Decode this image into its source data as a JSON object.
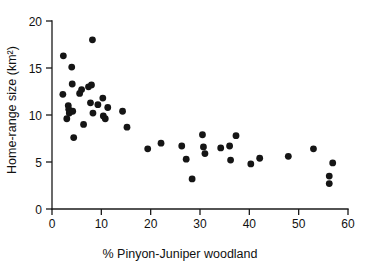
{
  "chart_data": {
    "type": "scatter",
    "title": "",
    "xlabel": "% Pinyon-Juniper woodland",
    "ylabel": "Home-range size (km²)",
    "xlim": [
      0,
      60
    ],
    "ylim": [
      0,
      20
    ],
    "xticks": [
      0,
      10,
      20,
      30,
      40,
      50,
      60
    ],
    "yticks": [
      0,
      5,
      10,
      15,
      20
    ],
    "xticklabels": [
      "0",
      "10",
      "20",
      "30",
      "40",
      "50",
      "60"
    ],
    "yticklabels": [
      "0",
      "5",
      "10",
      "15",
      "20"
    ],
    "grid": false,
    "legend": null,
    "marker": "filled-circle",
    "marker_color": "#151515",
    "points": [
      {
        "x": 2.3,
        "y": 16.3
      },
      {
        "x": 2.2,
        "y": 12.2
      },
      {
        "x": 3.0,
        "y": 9.6
      },
      {
        "x": 3.3,
        "y": 11.0
      },
      {
        "x": 3.4,
        "y": 10.6
      },
      {
        "x": 3.5,
        "y": 10.2
      },
      {
        "x": 4.0,
        "y": 15.1
      },
      {
        "x": 4.1,
        "y": 13.3
      },
      {
        "x": 4.2,
        "y": 10.4
      },
      {
        "x": 4.4,
        "y": 7.6
      },
      {
        "x": 5.6,
        "y": 12.3
      },
      {
        "x": 6.0,
        "y": 12.7
      },
      {
        "x": 6.4,
        "y": 9.0
      },
      {
        "x": 7.4,
        "y": 13.0
      },
      {
        "x": 7.8,
        "y": 11.3
      },
      {
        "x": 8.0,
        "y": 13.2
      },
      {
        "x": 8.2,
        "y": 18.0
      },
      {
        "x": 8.3,
        "y": 10.2
      },
      {
        "x": 9.3,
        "y": 11.1
      },
      {
        "x": 10.3,
        "y": 11.8
      },
      {
        "x": 10.4,
        "y": 9.9
      },
      {
        "x": 10.8,
        "y": 9.6
      },
      {
        "x": 11.3,
        "y": 10.8
      },
      {
        "x": 14.3,
        "y": 10.4
      },
      {
        "x": 15.2,
        "y": 8.7
      },
      {
        "x": 19.4,
        "y": 6.4
      },
      {
        "x": 22.1,
        "y": 7.0
      },
      {
        "x": 26.3,
        "y": 6.7
      },
      {
        "x": 27.2,
        "y": 5.3
      },
      {
        "x": 28.4,
        "y": 3.2
      },
      {
        "x": 30.5,
        "y": 7.9
      },
      {
        "x": 30.7,
        "y": 6.6
      },
      {
        "x": 31.0,
        "y": 5.9
      },
      {
        "x": 34.2,
        "y": 6.5
      },
      {
        "x": 36.0,
        "y": 6.7
      },
      {
        "x": 36.2,
        "y": 5.2
      },
      {
        "x": 37.3,
        "y": 7.8
      },
      {
        "x": 40.3,
        "y": 4.8
      },
      {
        "x": 42.1,
        "y": 5.4
      },
      {
        "x": 47.9,
        "y": 5.6
      },
      {
        "x": 53.0,
        "y": 6.4
      },
      {
        "x": 56.2,
        "y": 3.5
      },
      {
        "x": 56.2,
        "y": 2.7
      },
      {
        "x": 56.9,
        "y": 4.9
      }
    ]
  }
}
